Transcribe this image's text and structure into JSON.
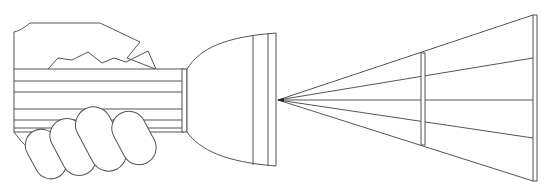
{
  "diagram": {
    "title": "",
    "colors": {
      "line": "#555555",
      "background": "#ffffff"
    },
    "elements": [
      {
        "name": "hand",
        "label": ""
      },
      {
        "name": "flashlight-handle",
        "label": ""
      },
      {
        "name": "flashlight-head",
        "label": ""
      },
      {
        "name": "light-source-point",
        "label": ""
      },
      {
        "name": "light-rays",
        "count": 5
      },
      {
        "name": "near-screen",
        "label": ""
      },
      {
        "name": "far-screen",
        "label": ""
      }
    ]
  }
}
